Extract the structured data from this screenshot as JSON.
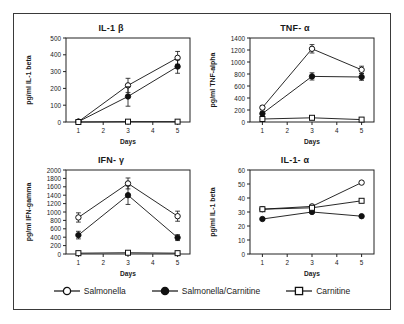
{
  "figure": {
    "x_axis_label": "Days",
    "x_ticks": [
      1,
      2,
      3,
      4,
      5
    ]
  },
  "legend": {
    "position": "bottom-center",
    "items": [
      {
        "label": "Salmonella",
        "marker": "open-circle",
        "color": "#111111"
      },
      {
        "label": "Salmonella/Carnitine",
        "marker": "filled-circle",
        "color": "#111111"
      },
      {
        "label": "Carnitine",
        "marker": "open-square",
        "color": "#111111"
      }
    ]
  },
  "chart_data": [
    {
      "id": "il1b",
      "type": "line",
      "title": "IL-1 β",
      "xlabel": "Days",
      "ylabel": "pg/ml IL-1 beta",
      "x": [
        1,
        3,
        5
      ],
      "xlim": [
        0.5,
        5.5
      ],
      "x_ticks": [
        1,
        2,
        3,
        4,
        5
      ],
      "ylim": [
        0,
        500
      ],
      "y_ticks": [
        0,
        100,
        200,
        300,
        400,
        500
      ],
      "grid": false,
      "series": [
        {
          "name": "Salmonella",
          "marker": "open-circle",
          "values": [
            2,
            218,
            382
          ],
          "errors": [
            4,
            42,
            38
          ]
        },
        {
          "name": "Salmonella/Carnitine",
          "marker": "filled-circle",
          "values": [
            2,
            152,
            330
          ],
          "errors": [
            4,
            58,
            40
          ]
        },
        {
          "name": "Carnitine",
          "marker": "open-square",
          "values": [
            0,
            2,
            2
          ],
          "errors": [
            0,
            0,
            0
          ]
        }
      ]
    },
    {
      "id": "tnfa",
      "type": "line",
      "title": "TNF- α",
      "xlabel": "Days",
      "ylabel": "pg/ml TNF-alpha",
      "x": [
        1,
        3,
        5
      ],
      "xlim": [
        0.5,
        5.5
      ],
      "x_ticks": [
        1,
        2,
        3,
        4,
        5
      ],
      "ylim": [
        0,
        1400
      ],
      "y_ticks": [
        0,
        200,
        400,
        600,
        800,
        1000,
        1200,
        1400
      ],
      "grid": false,
      "series": [
        {
          "name": "Salmonella",
          "marker": "open-circle",
          "values": [
            240,
            1220,
            870
          ],
          "errors": [
            30,
            70,
            60
          ]
        },
        {
          "name": "Salmonella/Carnitine",
          "marker": "filled-circle",
          "values": [
            140,
            760,
            750
          ],
          "errors": [
            40,
            60,
            55
          ]
        },
        {
          "name": "Carnitine",
          "marker": "open-square",
          "values": [
            50,
            70,
            40
          ],
          "errors": [
            10,
            10,
            10
          ]
        }
      ]
    },
    {
      "id": "ifng",
      "type": "line",
      "title": "IFN- γ",
      "xlabel": "Days",
      "ylabel": "pg/ml IFN-gamma",
      "x": [
        1,
        3,
        5
      ],
      "xlim": [
        0.5,
        5.5
      ],
      "x_ticks": [
        1,
        2,
        3,
        4,
        5
      ],
      "ylim": [
        0,
        2000
      ],
      "y_ticks": [
        0,
        200,
        400,
        600,
        800,
        1000,
        1200,
        1400,
        1600,
        1800,
        2000
      ],
      "grid": false,
      "series": [
        {
          "name": "Salmonella",
          "marker": "open-circle",
          "values": [
            870,
            1680,
            900
          ],
          "errors": [
            110,
            130,
            120
          ]
        },
        {
          "name": "Salmonella/Carnitine",
          "marker": "filled-circle",
          "values": [
            450,
            1400,
            390
          ],
          "errors": [
            90,
            220,
            70
          ]
        },
        {
          "name": "Carnitine",
          "marker": "open-square",
          "values": [
            20,
            30,
            20
          ],
          "errors": [
            0,
            0,
            0
          ]
        }
      ]
    },
    {
      "id": "il1a",
      "type": "line",
      "title": "IL-1- α",
      "xlabel": "Days",
      "ylabel": "pg/ml IL-1 beta",
      "x": [
        1,
        3,
        5
      ],
      "xlim": [
        0.5,
        5.5
      ],
      "x_ticks": [
        1,
        2,
        3,
        4,
        5
      ],
      "ylim": [
        0,
        60
      ],
      "y_ticks": [
        0,
        10,
        20,
        30,
        40,
        50,
        60
      ],
      "grid": false,
      "series": [
        {
          "name": "Salmonella",
          "marker": "open-circle",
          "values": [
            32,
            34,
            51
          ],
          "errors": [
            0,
            0,
            0
          ]
        },
        {
          "name": "Salmonella/Carnitine",
          "marker": "filled-circle",
          "values": [
            25,
            30,
            27
          ],
          "errors": [
            0,
            0,
            0
          ]
        },
        {
          "name": "Carnitine",
          "marker": "open-square",
          "values": [
            32,
            33,
            38
          ],
          "errors": [
            0,
            0,
            0
          ]
        }
      ]
    }
  ]
}
